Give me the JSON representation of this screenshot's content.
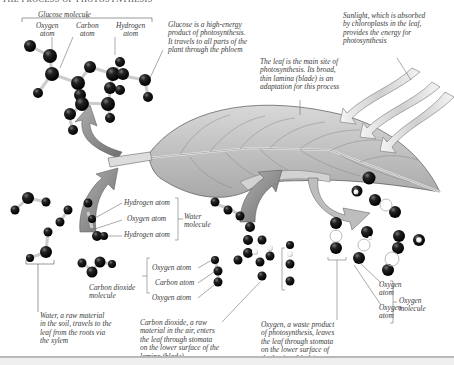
{
  "title": "THE PROCESS OF PHOTOSYNTHESIS",
  "glucose": {
    "bracket_label": "Glucose molecule",
    "oxygen_atom": "Oxygen\natom",
    "carbon_atom": "Carbon\natom",
    "hydrogen_atom": "Hydrogen\natom",
    "description": "Glucose is a high-energy\nproduct of photosynthesis.\nIt travels to all parts of the\nplant through the phloem"
  },
  "sunlight": {
    "description": "Sunlight, which is absorbed\nby chloroplasts in the leaf,\nprovides the energy for\nphotosynthesis"
  },
  "leaf": {
    "description": "The leaf is the main site of\nphotosynthesis. Its broad,\nthin lamina (blade) is an\nadaptation for this process"
  },
  "water": {
    "hydrogen_atom_1": "Hydrogen atom",
    "oxygen_atom": "Oxygen atom",
    "hydrogen_atom_2": "Hydrogen atom",
    "bracket_label": "Water\nmolecule",
    "description": "Water, a raw material\nin the soil, travels to the\nleaf from the roots via\nthe xylem"
  },
  "carbon_dioxide": {
    "bracket_label": "Carbon dioxide\nmolecule",
    "oxygen_atom_1": "Oxygen atom",
    "carbon_atom": "Carbon atom",
    "oxygen_atom_2": "Oxygen atom",
    "description": "Carbon dioxide, a raw\nmaterial in the air, enters\nthe leaf through stomata\non the lower surface of the\nlamina (blade)"
  },
  "oxygen": {
    "oxygen_atom_1": "Oxygen\natom",
    "oxygen_atom_2": "Oxygen\natom",
    "bracket_label": "Oxygen\nmolecule",
    "description": "Oxygen, a waste product\nof photosynthesis, leaves\nthe leaf through stomata\non the lower surface of\nthe lamina (blade)"
  },
  "colors": {
    "atom": "#111111",
    "arrow": "#8e8e8e",
    "leaf": "#c9c9c9",
    "text": "#3a3a3a"
  }
}
